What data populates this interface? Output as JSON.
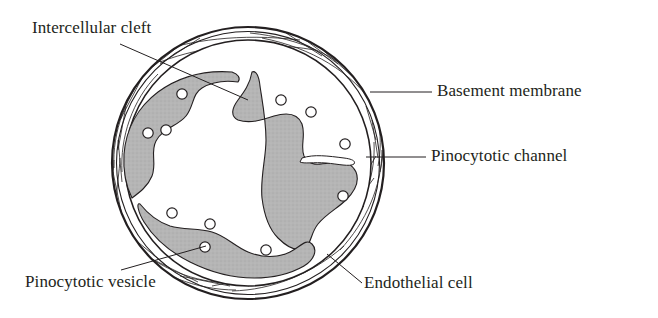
{
  "figure": {
    "background_color": "#ffffff",
    "ink_color": "#231f20",
    "cell_fill_color": "#b3b3b3",
    "lumen_color": "#ffffff"
  },
  "labels": {
    "intercellular_cleft": "Intercellular cleft",
    "basement_membrane": "Basement membrane",
    "pinocytotic_channel": "Pinocytotic channel",
    "pinocytotic_vesicle": "Pinocytotic vesicle",
    "endothelial_cell": "Endothelial cell"
  },
  "structures": [
    {
      "name": "basement-membrane",
      "shape": "annulus",
      "center": [
        248,
        163
      ],
      "outer_radius": 136,
      "inner_radius": 123,
      "description": "double-walled outer ring with criss-cross collagen fibers"
    },
    {
      "name": "endothelial-cell-ring",
      "shape": "broken-ring",
      "center": [
        248,
        163
      ],
      "outer_radius": 118,
      "inner_radius": 62,
      "description": "gray cytoplasm ring interrupted by intercellular clefts"
    },
    {
      "name": "capillary-lumen",
      "shape": "circle",
      "center": [
        240,
        160
      ],
      "radius": 62
    },
    {
      "name": "pinocytotic-channel",
      "shape": "slit",
      "position": [
        330,
        158
      ],
      "description": "white channel traversing the endothelial cell wall"
    }
  ],
  "vesicles": [
    [
      182,
      94
    ],
    [
      148,
      133
    ],
    [
      166,
      130
    ],
    [
      281,
      100
    ],
    [
      311,
      112
    ],
    [
      345,
      144
    ],
    [
      343,
      196
    ],
    [
      172,
      213
    ],
    [
      210,
      224
    ],
    [
      205,
      247
    ],
    [
      266,
      250
    ]
  ],
  "leaders": [
    {
      "name": "leader-intercellular-cleft",
      "from": [
        120,
        44
      ],
      "to": [
        248,
        100
      ]
    },
    {
      "name": "leader-basement-membrane",
      "from": [
        370,
        92
      ],
      "to": [
        430,
        92
      ]
    },
    {
      "name": "leader-pinocytotic-channel",
      "from": [
        368,
        157
      ],
      "to": [
        425,
        157
      ]
    },
    {
      "name": "leader-pinocytotic-vesicle",
      "from": [
        120,
        271
      ],
      "to": [
        205,
        247
      ]
    },
    {
      "name": "leader-endothelial-cell",
      "from": [
        363,
        284
      ],
      "to": [
        328,
        255
      ]
    }
  ]
}
